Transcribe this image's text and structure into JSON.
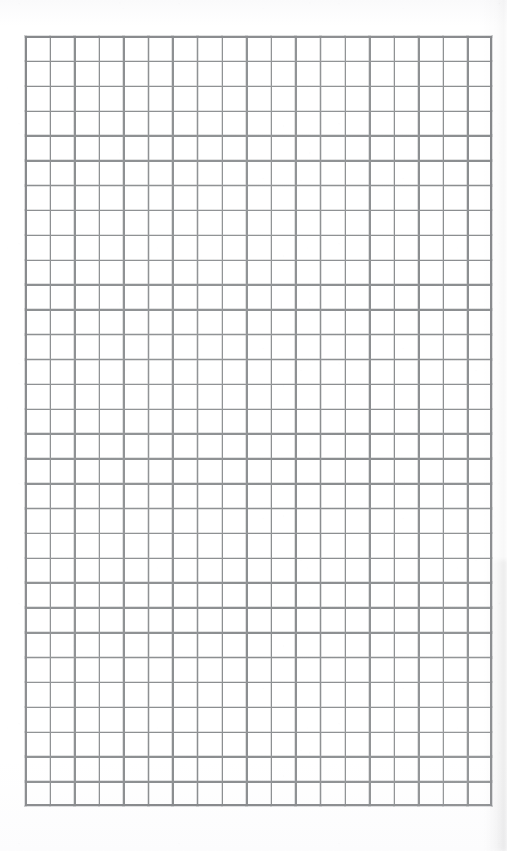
{
  "page": {
    "kind": "scanned-grid-paper",
    "width_px": 507,
    "height_px": 851,
    "background_color": "#ffffff"
  },
  "grid": {
    "label": "graph paper grid",
    "columns": 19,
    "rows": 31,
    "cell_width_px": 24.58,
    "cell_height_px": 24.84,
    "origin_x_px": 25,
    "origin_y_px": 36,
    "block_width_px": 467,
    "block_height_px": 770,
    "line_color": "#87898c",
    "line_width_px": 1.4
  },
  "margins": {
    "top_px": 36,
    "left_px": 25,
    "right_px": 15,
    "bottom_px": 45
  },
  "artifacts": {
    "right_edge_shadow": "soft vertical scan shadow along right margin",
    "paper_texture": "faint speckled scan noise",
    "shadow_color": "#000000"
  },
  "content": {
    "text": "",
    "note": "The sheet is blank — no writing, headings, numbers or marks are present."
  }
}
